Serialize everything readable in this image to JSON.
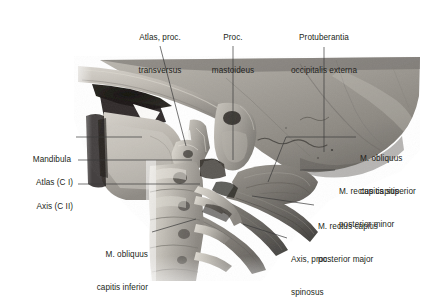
{
  "figure": {
    "type": "anatomical-illustration",
    "style": "grayscale-halftone",
    "background_color": "#ffffff",
    "text_color": "#231f20",
    "leader_line_color": "#3a3a3a"
  },
  "labels": {
    "atlas_proc_transversus": {
      "line1": "Atlas, proc.",
      "line2": "transversus"
    },
    "proc_mastoideus": {
      "line1": "Proc.",
      "line2": "mastoideus"
    },
    "protuberantia_occipitalis_externa": {
      "line1": "Protuberantia",
      "line2": "occipitalis externa"
    },
    "mandibula": {
      "line1": "Mandibula"
    },
    "atlas_ci": {
      "line1": "Atlas (C I)"
    },
    "axis_cii": {
      "line1": "Axis (C II)"
    },
    "m_obliquus_capitis_superior": {
      "line1": "M. obliquus",
      "line2": "capitis superior"
    },
    "m_rectus_capitis_posterior_minor": {
      "line1": "M. rectus capitis",
      "line2": "posterior minor"
    },
    "m_rectus_capitis_posterior_major": {
      "line1": "M. rectus capitis",
      "line2": "posterior major"
    },
    "axis_proc_spinosus": {
      "line1": "Axis, proc.",
      "line2": "spinosus"
    },
    "m_obliquus_capitis_inferior": {
      "line1": "M. obliquus",
      "line2": "capitis inferior"
    }
  },
  "structures": [
    {
      "name": "cranium-occipital-bone",
      "region": "upper-right"
    },
    {
      "name": "zygomatic-arch",
      "region": "upper-left"
    },
    {
      "name": "mandible-ramus",
      "region": "left-middle"
    },
    {
      "name": "mastoid-process",
      "region": "center"
    },
    {
      "name": "atlas-transverse-process",
      "region": "center"
    },
    {
      "name": "cervical-vertebrae",
      "region": "lower-center"
    },
    {
      "name": "obliquus-capitis-superior-muscle",
      "region": "right-middle"
    },
    {
      "name": "rectus-capitis-posterior-major-muscle",
      "region": "right"
    },
    {
      "name": "obliquus-capitis-inferior-muscle",
      "region": "lower-center"
    }
  ]
}
